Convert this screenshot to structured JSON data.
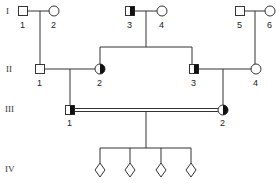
{
  "diagram": {
    "type": "pedigree",
    "generations": [
      {
        "label": "I",
        "y": 11,
        "label_y": 14
      },
      {
        "label": "II",
        "y": 69,
        "label_y": 72
      },
      {
        "label": "III",
        "y": 110,
        "label_y": 112
      },
      {
        "label": "IV",
        "y": 170,
        "label_y": 172
      }
    ],
    "individuals": [
      {
        "id": "I-1",
        "num": "1",
        "sex": "male",
        "status": "unaffected",
        "x": 23,
        "y": 11
      },
      {
        "id": "I-2",
        "num": "2",
        "sex": "female",
        "status": "unaffected",
        "x": 54,
        "y": 11
      },
      {
        "id": "I-3",
        "num": "3",
        "sex": "male",
        "status": "carrier",
        "x": 130,
        "y": 11
      },
      {
        "id": "I-4",
        "num": "4",
        "sex": "female",
        "status": "unaffected",
        "x": 162,
        "y": 11
      },
      {
        "id": "I-5",
        "num": "5",
        "sex": "male",
        "status": "unaffected",
        "x": 240,
        "y": 11
      },
      {
        "id": "I-6",
        "num": "6",
        "sex": "female",
        "status": "unaffected",
        "x": 270,
        "y": 11
      },
      {
        "id": "II-1",
        "num": "1",
        "sex": "male",
        "status": "unaffected",
        "x": 40,
        "y": 69
      },
      {
        "id": "II-2",
        "num": "2",
        "sex": "female",
        "status": "carrier",
        "x": 100,
        "y": 69
      },
      {
        "id": "II-3",
        "num": "3",
        "sex": "male",
        "status": "carrier",
        "x": 194,
        "y": 69
      },
      {
        "id": "II-4",
        "num": "4",
        "sex": "female",
        "status": "unaffected",
        "x": 256,
        "y": 69
      },
      {
        "id": "III-1",
        "num": "1",
        "sex": "male",
        "status": "carrier",
        "x": 70,
        "y": 110
      },
      {
        "id": "III-2",
        "num": "2",
        "sex": "female",
        "status": "carrier",
        "x": 223,
        "y": 110
      },
      {
        "id": "IV-a",
        "num": "",
        "sex": "unknown",
        "status": "unknown",
        "x": 100,
        "y": 170
      },
      {
        "id": "IV-b",
        "num": "",
        "sex": "unknown",
        "status": "unknown",
        "x": 130,
        "y": 170
      },
      {
        "id": "IV-c",
        "num": "",
        "sex": "unknown",
        "status": "unknown",
        "x": 161,
        "y": 170
      },
      {
        "id": "IV-d",
        "num": "",
        "sex": "unknown",
        "status": "unknown",
        "x": 191,
        "y": 170
      }
    ],
    "matings": [
      {
        "partners": [
          "I-1",
          "I-2"
        ],
        "consanguineous": false
      },
      {
        "partners": [
          "I-3",
          "I-4"
        ],
        "consanguineous": false
      },
      {
        "partners": [
          "I-5",
          "I-6"
        ],
        "consanguineous": false
      },
      {
        "partners": [
          "II-1",
          "II-2"
        ],
        "consanguineous": false
      },
      {
        "partners": [
          "II-3",
          "II-4"
        ],
        "consanguineous": false
      },
      {
        "partners": [
          "III-1",
          "III-2"
        ],
        "consanguineous": true
      }
    ],
    "colors": {
      "line": "#333333",
      "fill": "#111111",
      "background": "#ffffff"
    }
  }
}
